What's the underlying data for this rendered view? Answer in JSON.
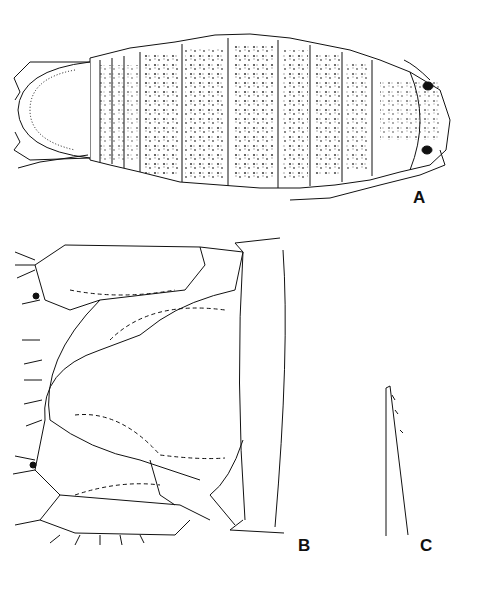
{
  "figure": {
    "panels": [
      {
        "id": "A",
        "label": "A",
        "description": "dorsal view of whole isopod with pigment pattern"
      },
      {
        "id": "B",
        "label": "B",
        "description": "pleotelson and uropods"
      },
      {
        "id": "C",
        "label": "C",
        "description": "spine / seta detail"
      }
    ]
  }
}
